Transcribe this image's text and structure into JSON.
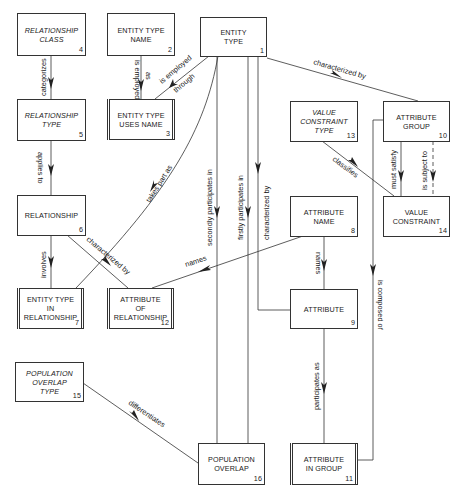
{
  "diagram": {
    "type": "entity-relationship",
    "entities": [
      {
        "id": 1,
        "name": "ENTITY\nTYPE",
        "num": "1",
        "style": "normal"
      },
      {
        "id": 2,
        "name": "ENTITY TYPE\nNAME",
        "num": "2",
        "style": "normal"
      },
      {
        "id": 3,
        "name": "ENTITY TYPE\nUSES NAME",
        "num": "3",
        "style": "double"
      },
      {
        "id": 4,
        "name": "RELATIONSHIP\nCLASS",
        "num": "4",
        "style": "italic"
      },
      {
        "id": 5,
        "name": "RELATIONSHIP\nTYPE",
        "num": "5",
        "style": "italic"
      },
      {
        "id": 6,
        "name": "RELATIONSHIP",
        "num": "6",
        "style": "normal"
      },
      {
        "id": 7,
        "name": "ENTITY TYPE\nIN\nRELATIONSHIP",
        "num": "7",
        "style": "double"
      },
      {
        "id": 8,
        "name": "ATTRIBUTE\nNAME",
        "num": "8",
        "style": "normal"
      },
      {
        "id": 9,
        "name": "ATTRIBUTE",
        "num": "9",
        "style": "normal"
      },
      {
        "id": 10,
        "name": "ATTRIBUTE\nGROUP",
        "num": "10",
        "style": "normal"
      },
      {
        "id": 11,
        "name": "ATTRIBUTE\nIN GROUP",
        "num": "11",
        "style": "double"
      },
      {
        "id": 12,
        "name": "ATTRIBUTE\nOF\nRELATIONSHIP",
        "num": "12",
        "style": "double"
      },
      {
        "id": 13,
        "name": "VALUE\nCONSTRAINT\nTYPE",
        "num": "13",
        "style": "italic"
      },
      {
        "id": 14,
        "name": "VALUE\nCONSTRAINT",
        "num": "14",
        "style": "normal"
      },
      {
        "id": 15,
        "name": "POPULATION\nOVERLAP\nTYPE",
        "num": "15",
        "style": "italic"
      },
      {
        "id": 16,
        "name": "POPULATION\nOVERLAP",
        "num": "16",
        "style": "normal"
      }
    ],
    "relationships": [
      {
        "from": 4,
        "to": 5,
        "label": "categorizes"
      },
      {
        "from": 2,
        "to": 3,
        "label": "is employed as"
      },
      {
        "from": 1,
        "to": 3,
        "label": "is employed through"
      },
      {
        "from": 1,
        "to": 10,
        "label": "characterized by"
      },
      {
        "from": 5,
        "to": 6,
        "label": "applies to"
      },
      {
        "from": 1,
        "to": 7,
        "label": "takes part as"
      },
      {
        "from": 1,
        "to": 16,
        "label": "secondly participates in"
      },
      {
        "from": 1,
        "to": 16,
        "label": "firstly participates in"
      },
      {
        "from": 1,
        "to": 9,
        "label": "characterized by"
      },
      {
        "from": 13,
        "to": 14,
        "label": "classifies"
      },
      {
        "from": 10,
        "to": 14,
        "label": "must satisfy"
      },
      {
        "from": 10,
        "to": 14,
        "label": "is subject to",
        "dashed": true
      },
      {
        "from": 6,
        "to": 7,
        "label": "involves"
      },
      {
        "from": 6,
        "to": 12,
        "label": "characterized by"
      },
      {
        "from": 8,
        "to": 12,
        "label": "names"
      },
      {
        "from": 8,
        "to": 9,
        "label": "names"
      },
      {
        "from": 10,
        "to": 11,
        "label": "is composed of"
      },
      {
        "from": 9,
        "to": 11,
        "label": "participates as"
      },
      {
        "from": 15,
        "to": 16,
        "label": "differentiates"
      }
    ]
  },
  "labels": {
    "categorizes": "categorizes",
    "is_employed": "is employed",
    "as": "as",
    "is_employed2": "is employed",
    "through": "through",
    "characterized_by_1_10": "characterized by",
    "applies_to": "applies to",
    "takes_part_as": "takes part as",
    "secondly_participates_in": "secondly participates in",
    "firstly_participates_in": "firstly participates in",
    "characterized_by_1_9": "characterized by",
    "classifies": "classifies",
    "must_satisfy": "must satisfy",
    "is_subject_to": "is subject to",
    "involves": "involves",
    "characterized_by_6_12": "characterized by",
    "names_8_12": "names",
    "names_8_9": "names",
    "is_composed_of": "is composed of",
    "participates_as": "participates as",
    "differentiates": "differentiates"
  },
  "boxes": {
    "b1": {
      "name": "ENTITY\nTYPE",
      "num": "1"
    },
    "b2": {
      "name": "ENTITY TYPE\nNAME",
      "num": "2"
    },
    "b3": {
      "name": "ENTITY TYPE\nUSES NAME",
      "num": "3"
    },
    "b4": {
      "name": "RELATIONSHIP\nCLASS",
      "num": "4"
    },
    "b5": {
      "name": "RELATIONSHIP\nTYPE",
      "num": "5"
    },
    "b6": {
      "name": "RELATIONSHIP",
      "num": "6"
    },
    "b7": {
      "name": "ENTITY TYPE\nIN\nRELATIONSHIP",
      "num": "7"
    },
    "b8": {
      "name": "ATTRIBUTE\nNAME",
      "num": "8"
    },
    "b9": {
      "name": "ATTRIBUTE",
      "num": "9"
    },
    "b10": {
      "name": "ATTRIBUTE\nGROUP",
      "num": "10"
    },
    "b11": {
      "name": "ATTRIBUTE\nIN GROUP",
      "num": "11"
    },
    "b12": {
      "name": "ATTRIBUTE\nOF\nRELATIONSHIP",
      "num": "12"
    },
    "b13": {
      "name": "VALUE\nCONSTRAINT\nTYPE",
      "num": "13"
    },
    "b14": {
      "name": "VALUE\nCONSTRAINT",
      "num": "14"
    },
    "b15": {
      "name": "POPULATION\nOVERLAP\nTYPE",
      "num": "15"
    },
    "b16": {
      "name": "POPULATION\nOVERLAP",
      "num": "16"
    }
  }
}
